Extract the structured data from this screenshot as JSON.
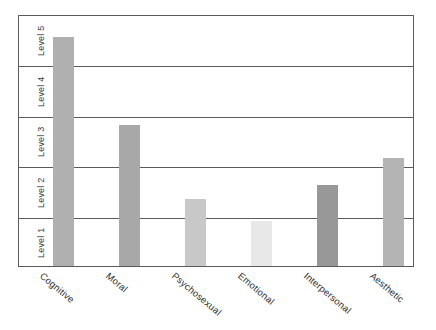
{
  "chart_data": {
    "type": "bar",
    "title": "",
    "xlabel": "",
    "ylabel": "",
    "categories": [
      "Cognitive",
      "Moral",
      "Psychosexual",
      "Emotional",
      "Interpersonal",
      "Aesthetic"
    ],
    "values": [
      4.55,
      2.8,
      1.33,
      0.89,
      1.61,
      2.14
    ],
    "bar_colors": [
      "#b0b0b0",
      "#a8a8a8",
      "#c8c8c8",
      "#e8e8e8",
      "#989898",
      "#b4b4b4"
    ],
    "ytick_labels": [
      "Level 1",
      "Level 2",
      "Level 3",
      "Level 4",
      "Level 5"
    ],
    "ylim": [
      0,
      5
    ],
    "grid": true,
    "legend": "none",
    "axis_color": "#5a5a5a",
    "background": "#ffffff",
    "bars": [
      {
        "category": "Cognitive",
        "value": 4.55,
        "color": "#b0b0b0"
      },
      {
        "category": "Moral",
        "value": 2.8,
        "color": "#a8a8a8"
      },
      {
        "category": "Psychosexual",
        "value": 1.33,
        "color": "#c8c8c8"
      },
      {
        "category": "Emotional",
        "value": 0.89,
        "color": "#e8e8e8"
      },
      {
        "category": "Interpersonal",
        "value": 1.61,
        "color": "#989898"
      },
      {
        "category": "Aesthetic",
        "value": 2.14,
        "color": "#b4b4b4"
      }
    ]
  }
}
